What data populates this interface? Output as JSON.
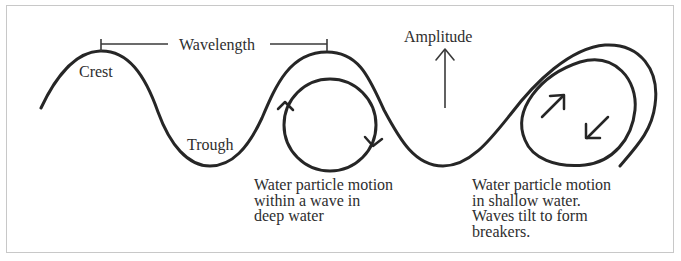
{
  "diagram": {
    "labels": {
      "crest": "Crest",
      "trough": "Trough",
      "wavelength": "Wavelength",
      "amplitude": "Amplitude",
      "deep_water_caption": "Water particle motion\nwithin a wave in\ndeep water",
      "shallow_water_caption": "Water particle motion\nin shallow water.\nWaves tilt to form\nbreakers."
    },
    "elements": [
      {
        "id": "wave-profile",
        "type": "curve",
        "description": "Wave line with crests and troughs ending in a breaking wave"
      },
      {
        "id": "wavelength-bracket",
        "type": "dimension-line",
        "from": "crest-1",
        "to": "crest-2"
      },
      {
        "id": "amplitude-arrow",
        "type": "arrow",
        "direction": "up"
      },
      {
        "id": "deep-water-orbit",
        "type": "circle",
        "arrows": [
          "up-left-side",
          "down-right-side"
        ],
        "rotation": "clockwise"
      },
      {
        "id": "breaker-orbit",
        "type": "tilted-loop",
        "arrows": [
          "up-right",
          "down-left"
        ]
      }
    ],
    "colors": {
      "stroke": "#262626",
      "text": "#2e2e2e",
      "frame": "#c8c8c8",
      "background": "#ffffff"
    }
  }
}
